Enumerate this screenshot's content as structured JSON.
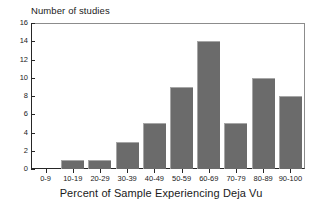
{
  "chart_data": {
    "type": "bar",
    "title": "",
    "xlabel": "Percent of Sample Experiencing Deja Vu",
    "ylabel": "Number of studies",
    "categories": [
      "0-9",
      "10-19",
      "20-29",
      "30-39",
      "40-49",
      "50-59",
      "60-69",
      "70-79",
      "80-89",
      "90-100"
    ],
    "values": [
      0,
      1,
      1,
      3,
      5,
      9,
      14,
      5,
      10,
      8
    ],
    "ylim": [
      0,
      16
    ],
    "ytick_labels": [
      "0",
      "2",
      "4",
      "6",
      "8",
      "10",
      "12",
      "14",
      "16"
    ],
    "ytick_values": [
      0,
      2,
      4,
      6,
      8,
      10,
      12,
      14,
      16
    ],
    "grid": false,
    "legend": "none",
    "bar_color": "#6b6b6b",
    "axis_color": "#262626",
    "frame_color": "#8c8c8c",
    "background": "#ffffff"
  }
}
